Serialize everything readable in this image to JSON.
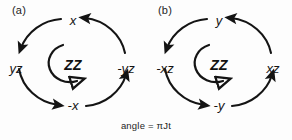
{
  "figure": {
    "caption": "angle = πJt",
    "background_color": "#fdfdfd",
    "ink_color": "#141414",
    "rotation_sense": "counter-clockwise"
  },
  "panels": [
    {
      "tag": "(a)",
      "center": "ZZ",
      "center_arrow": "c-shaped-arc-open-arrowhead",
      "labels": {
        "top": "x",
        "right": "-yz",
        "bottom": "-x",
        "left": "yz"
      },
      "cycle": [
        "x",
        "yz",
        "-x",
        "-yz"
      ]
    },
    {
      "tag": "(b)",
      "center": "ZZ",
      "center_arrow": "c-shaped-arc-open-arrowhead",
      "labels": {
        "top": "y",
        "right": "xz",
        "bottom": "-y",
        "left": "-xz"
      },
      "cycle": [
        "y",
        "-xz",
        "-y",
        "xz"
      ]
    }
  ]
}
